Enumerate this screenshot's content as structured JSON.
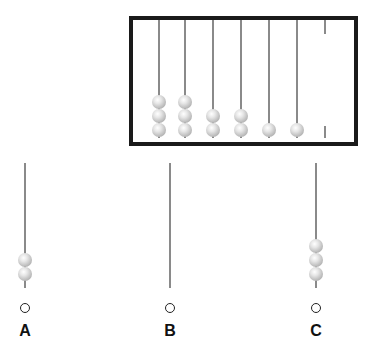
{
  "abacus": {
    "rods": [
      {
        "x": 159,
        "beads": 3
      },
      {
        "x": 185,
        "beads": 3
      },
      {
        "x": 213,
        "beads": 2
      },
      {
        "x": 241,
        "beads": 2
      },
      {
        "x": 269,
        "beads": 1
      },
      {
        "x": 297,
        "beads": 1
      }
    ],
    "partial_rod_x": 325
  },
  "options": [
    {
      "label": "A",
      "x": 25,
      "beads": 2
    },
    {
      "label": "B",
      "x": 170,
      "beads": 0
    },
    {
      "label": "C",
      "x": 316,
      "beads": 3
    }
  ],
  "colors": {
    "frame": "#1a1a1a",
    "rod": "#8a8a8a",
    "bead": "#c0c0c0"
  }
}
